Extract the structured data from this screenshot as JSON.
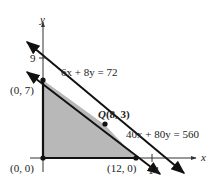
{
  "diagram": {
    "axes": {
      "x_label": "x",
      "y_label": "y"
    },
    "ticks": {
      "y_tick": "9",
      "x_tick": "14"
    },
    "vertices": [
      {
        "label": "(0, 7)"
      },
      {
        "label": "(0, 0)"
      },
      {
        "label": "(12, 0)"
      }
    ],
    "optimal_point": {
      "name": "Q",
      "coords": "(8, 3)"
    },
    "lines": [
      {
        "equation": "6x + 8y = 72"
      },
      {
        "equation": "40x + 80y = 560"
      }
    ],
    "colors": {
      "line": "#111111",
      "feasible_region": "#b8b8b8",
      "text": "#222222"
    }
  }
}
